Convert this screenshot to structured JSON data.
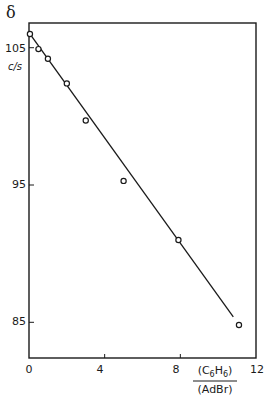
{
  "chart_data": {
    "type": "scatter",
    "title": "",
    "ylabel_symbol": "δ",
    "ylabel_unit": "c/s",
    "xlabel_numerator": "(C6H6)",
    "xlabel_denominator": "(AdBr)",
    "xlim": [
      0,
      12
    ],
    "ylim": [
      82.4,
      106.8
    ],
    "x_ticks": [
      "0",
      "4",
      "8",
      "12"
    ],
    "y_ticks": [
      "105",
      "95",
      "85"
    ],
    "grid": false,
    "legend": null,
    "series": [
      {
        "name": "observed",
        "marker": "open-circle",
        "x": [
          0.05,
          0.5,
          1.0,
          2.0,
          3.0,
          5.0,
          7.9,
          11.1
        ],
        "y": [
          106.0,
          104.9,
          104.2,
          102.4,
          99.7,
          95.3,
          91.0,
          84.8
        ]
      },
      {
        "name": "fit-line",
        "marker": "line",
        "x": [
          0.0,
          10.8
        ],
        "y": [
          106.1,
          85.4
        ]
      }
    ]
  }
}
